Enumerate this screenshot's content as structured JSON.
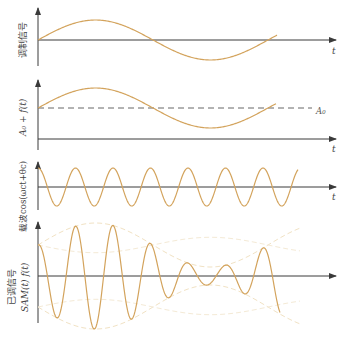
{
  "figure": {
    "colors": {
      "axis": "#3a3a3a",
      "signal": "#d3a35c",
      "envelope": "#f1e2c4",
      "dashed": "#555555",
      "text": "#444444"
    },
    "panels": [
      {
        "id": "modulating",
        "ylabel": "调制信号",
        "xlabel": "t",
        "description": "one period of a low-frequency sine f(t)"
      },
      {
        "id": "biased",
        "ylabel": "A₀ + f(t)",
        "xlabel": "t",
        "reference_label": "A₀",
        "description": "sine shifted up by DC level A0 (dashed line)"
      },
      {
        "id": "carrier",
        "ylabel": "载波cos(ωct+θc)",
        "xlabel": "t",
        "description": "high-frequency carrier, about 7 cycles"
      },
      {
        "id": "am-signal",
        "ylabel_line1": "已调信号",
        "ylabel_line2": "SAM(t)  f(t)",
        "xlabel": "",
        "description": "AM modulated signal with faint envelope curves"
      }
    ]
  }
}
